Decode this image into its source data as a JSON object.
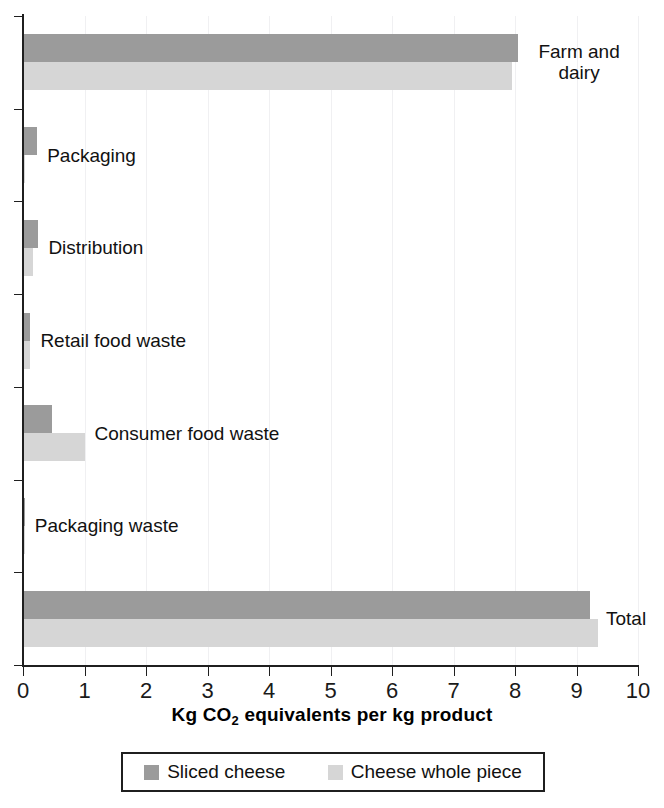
{
  "chart_data": {
    "type": "bar",
    "orientation": "horizontal",
    "title": "",
    "xlabel": "Kg CO2 equivalents per kg product",
    "xlabel_parts": {
      "pre": "Kg CO",
      "sub": "2",
      "post": " equivalents per kg product"
    },
    "ylabel": "",
    "xlim": [
      0,
      10
    ],
    "xticks": [
      0,
      1,
      2,
      3,
      4,
      5,
      6,
      7,
      8,
      9,
      10
    ],
    "xtick_labels": [
      "0",
      "1",
      "2",
      "3",
      "4",
      "5",
      "6",
      "7",
      "8",
      "9",
      "10"
    ],
    "grid": true,
    "grid_axis": "x",
    "legend_position": "bottom",
    "categories": [
      "Farm and dairy",
      "Packaging",
      "Distribution",
      "Retail food waste",
      "Consumer food waste",
      "Packaging waste",
      "Total"
    ],
    "series": [
      {
        "name": "Sliced cheese",
        "color": "#9b9b9b",
        "values": [
          8.05,
          0.23,
          0.25,
          0.12,
          0.47,
          0.03,
          9.22
        ]
      },
      {
        "name": "Cheese whole piece",
        "color": "#d6d6d6",
        "values": [
          7.95,
          0.03,
          0.17,
          0.11,
          1.0,
          0.03,
          9.35
        ]
      }
    ]
  },
  "legend": {
    "entries": [
      {
        "label": "Sliced cheese",
        "color": "#9b9b9b"
      },
      {
        "label": "Cheese whole piece",
        "color": "#d6d6d6"
      }
    ]
  },
  "colors": {
    "sliced_cheese": "#9b9b9b",
    "whole_piece": "#d6d6d6",
    "axis": "#1f1f1f",
    "gridline": "#f0f0f2",
    "text": "#111111"
  }
}
